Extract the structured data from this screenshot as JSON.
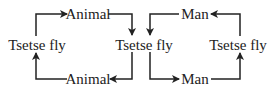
{
  "diagram": {
    "type": "transmission-cycle",
    "colors": {
      "line": "#222222",
      "text": "#222222",
      "background": "#ffffff"
    },
    "nodes": {
      "left_fly": "Tsetse fly",
      "top_left_host": "Animal",
      "bottom_left_host": "Animal",
      "center_fly": "Tsetse fly",
      "top_right_host": "Man",
      "bottom_right_host": "Man",
      "right_fly": "Tsetse fly"
    },
    "edges": [
      {
        "from": "left_fly",
        "to": "top_left_host"
      },
      {
        "from": "top_left_host",
        "to": "center_fly"
      },
      {
        "from": "center_fly",
        "to": "bottom_left_host"
      },
      {
        "from": "bottom_left_host",
        "to": "left_fly"
      },
      {
        "from": "top_right_host",
        "to": "center_fly"
      },
      {
        "from": "center_fly",
        "to": "bottom_right_host"
      },
      {
        "from": "bottom_right_host",
        "to": "right_fly"
      },
      {
        "from": "right_fly",
        "to": "top_right_host"
      }
    ]
  }
}
